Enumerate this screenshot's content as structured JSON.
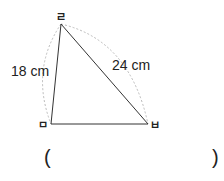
{
  "figure": {
    "vertices": {
      "top": "ㄹ",
      "bottom_left": "ㅁ",
      "bottom_right": "ㅂ"
    },
    "side_labels": {
      "left": "18 cm",
      "right": "24 cm"
    },
    "answer_open": "(",
    "answer_close": ")"
  }
}
